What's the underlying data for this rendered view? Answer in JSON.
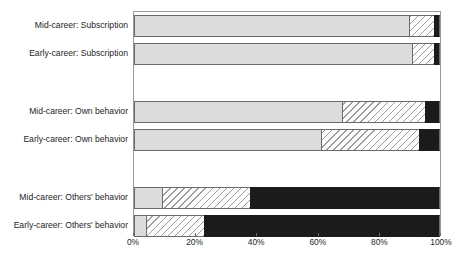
{
  "chart_data": {
    "type": "bar",
    "orientation": "horizontal",
    "stacked": true,
    "normalized": true,
    "title": "",
    "subtitle": "",
    "xlabel": "",
    "ylabel": "",
    "xlim": [
      0,
      100
    ],
    "xticks": [
      0,
      20,
      40,
      60,
      80,
      100
    ],
    "xtick_labels": [
      "0%",
      "20%",
      "40%",
      "60%",
      "80%",
      "100%"
    ],
    "grid": false,
    "legend": "none",
    "categories": [
      "Mid-career: Subscription",
      "Early-career: Subscription",
      "Mid-career: Own behavior",
      "Early-career: Own behavior",
      "Mid-career: Others' behavior",
      "Early-career: Others' behavior"
    ],
    "series": [
      {
        "name": "light-gray",
        "fill": "#dcdcdc",
        "pattern": "solid",
        "values": [
          90,
          91,
          68,
          61,
          9,
          4
        ]
      },
      {
        "name": "hatched",
        "fill": "#fdfdfd",
        "pattern": "diagonal-hatch",
        "values": [
          8,
          7,
          27,
          32,
          29,
          19
        ]
      },
      {
        "name": "black",
        "fill": "#1b1b1b",
        "pattern": "solid",
        "values": [
          2,
          2,
          5,
          7,
          62,
          77
        ]
      }
    ],
    "groups": [
      {
        "name": "Subscription",
        "rows": [
          0,
          1
        ]
      },
      {
        "name": "Own behavior",
        "rows": [
          2,
          3
        ]
      },
      {
        "name": "Others' behavior",
        "rows": [
          4,
          5
        ]
      }
    ],
    "row_tops_px": [
      3,
      31,
      89,
      117,
      175,
      203
    ],
    "colors": {
      "gray": "#dcdcdc",
      "hatch_line": "#9d9d9d",
      "hatch_bg": "#fdfdfd",
      "black": "#1b1b1b",
      "axis": "#6b6b6b",
      "text": "#262626",
      "background": "#ffffff"
    }
  }
}
